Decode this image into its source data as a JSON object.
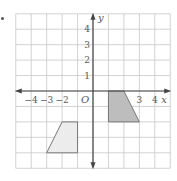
{
  "figure": {
    "bullet": "•",
    "grid": {
      "xmin": -5,
      "xmax": 5,
      "ymin": -5,
      "ymax": 5,
      "step": 1
    },
    "axes": {
      "x_label": "x",
      "y_label": "y",
      "origin_label": "O",
      "x_tick_labels": [
        {
          "value": -4,
          "label": "−4"
        },
        {
          "value": -3,
          "label": "−3"
        },
        {
          "value": -2,
          "label": "−2"
        },
        {
          "value": 3,
          "label": "3"
        },
        {
          "value": 4,
          "label": "4"
        }
      ],
      "y_tick_labels": [
        {
          "value": 1,
          "label": "1"
        },
        {
          "value": 2,
          "label": "2"
        },
        {
          "value": 3,
          "label": "3"
        },
        {
          "value": 4,
          "label": "4"
        }
      ]
    },
    "shapes": [
      {
        "name": "dark-trapezoid",
        "vertices": [
          [
            1,
            0
          ],
          [
            2,
            0
          ],
          [
            3,
            -2
          ],
          [
            1,
            -2
          ]
        ],
        "fill": "#bdbdbd",
        "stroke": "#777777"
      },
      {
        "name": "light-trapezoid",
        "vertices": [
          [
            -2,
            -2
          ],
          [
            -1,
            -2
          ],
          [
            -1,
            -4
          ],
          [
            -3,
            -4
          ]
        ],
        "fill": "#ececec",
        "stroke": "#777777"
      }
    ],
    "colors": {
      "grid": "#c8c8c8",
      "axis": "#444444",
      "label": "#555555"
    }
  }
}
